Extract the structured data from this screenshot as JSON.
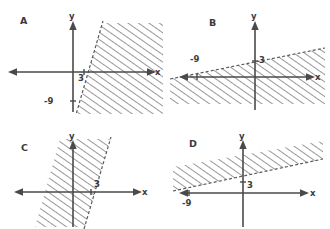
{
  "figure": {
    "background_color": "#ffffff",
    "ink_color": "#3b3b3b",
    "axis_color": "#4a4a4a",
    "panel_count": 4
  },
  "panels": [
    {
      "id": "A",
      "letter": "A",
      "x_axis_label": "x",
      "y_axis_label": "y",
      "tick_labels": [
        {
          "text": "3",
          "axis": "x",
          "value": 3
        },
        {
          "text": "-9",
          "axis": "y",
          "value": -9
        }
      ],
      "boundary": {
        "style": "dashed",
        "x_intercept": 3,
        "y_intercept": -9,
        "slope": 3,
        "description": "steep rising dashed line through (3,0) and (0,-9)"
      },
      "shading": {
        "side": "right",
        "pattern": "diagonal-hatch",
        "hatch_direction": "up-right",
        "description": "region to the right of / below-right of the boundary line"
      }
    },
    {
      "id": "B",
      "letter": "B",
      "x_axis_label": "x",
      "y_axis_label": "y",
      "tick_labels": [
        {
          "text": "-9",
          "axis": "x",
          "value": -9
        },
        {
          "text": "3",
          "axis": "y",
          "value": 3
        }
      ],
      "boundary": {
        "style": "dashed",
        "x_intercept": -9,
        "y_intercept": 3,
        "slope": 0.3333,
        "description": "shallow rising dashed line through (-9,0) and (0,3)"
      },
      "shading": {
        "side": "below",
        "pattern": "diagonal-hatch",
        "hatch_direction": "up-right",
        "description": "region below the shallow boundary line"
      }
    },
    {
      "id": "C",
      "letter": "C",
      "x_axis_label": "x",
      "y_axis_label": "y",
      "tick_labels": [
        {
          "text": "3",
          "axis": "x",
          "value": 3
        }
      ],
      "boundary": {
        "style": "dashed",
        "x_intercept": 3,
        "y_intercept": -9,
        "slope": 3,
        "description": "steep rising dashed line through (3,0)"
      },
      "shading": {
        "side": "left",
        "pattern": "diagonal-hatch",
        "hatch_direction": "up-right",
        "description": "region to the left of / above-left of the boundary line"
      }
    },
    {
      "id": "D",
      "letter": "D",
      "x_axis_label": "x",
      "y_axis_label": "y",
      "tick_labels": [
        {
          "text": "-9",
          "axis": "x",
          "value": -9
        },
        {
          "text": "3",
          "axis": "y",
          "value": 3
        }
      ],
      "boundary": {
        "style": "dashed",
        "x_intercept": -9,
        "y_intercept": 3,
        "slope": 0.3333,
        "description": "shallow rising dashed line through (-9,0) and (0,3)"
      },
      "shading": {
        "side": "above",
        "pattern": "diagonal-hatch",
        "hatch_direction": "up-right",
        "description": "region above the shallow boundary line"
      }
    }
  ]
}
